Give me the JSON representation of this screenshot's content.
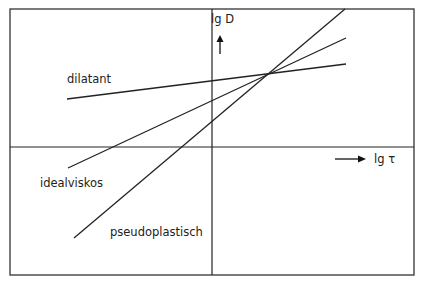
{
  "diagram": {
    "y_axis_label": "lg D",
    "x_axis_label": "lg τ",
    "curves": [
      {
        "name": "dilatant",
        "label": "dilatant"
      },
      {
        "name": "idealviskos",
        "label": "idealviskos"
      },
      {
        "name": "pseudoplastisch",
        "label": "pseudoplastisch"
      }
    ],
    "colors": {
      "line": "#222222",
      "frame": "#333333",
      "background": "#ffffff"
    }
  }
}
